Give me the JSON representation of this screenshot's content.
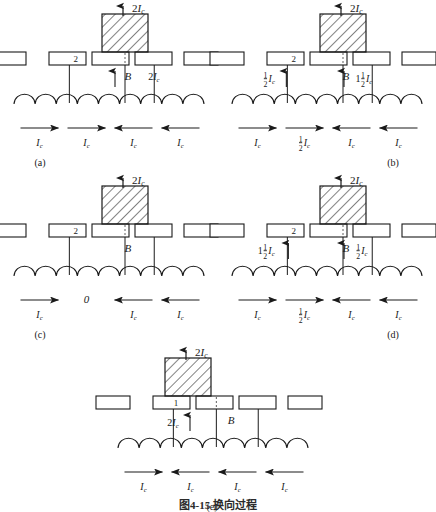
{
  "figure": {
    "caption": "图4-15  换向过程",
    "panels": [
      {
        "id": "a",
        "label": "(a)",
        "segment_label": "2",
        "top_arrow_label": "2Iᴄ",
        "field_label": "B",
        "inner_labels": [
          {
            "text": "B",
            "arrow": "none"
          },
          {
            "text": "2Iᴄ",
            "arrow": "up"
          }
        ],
        "bottom_labels": [
          "Iᴄ",
          "Iᴄ",
          "Iᴄ",
          "Iᴄ"
        ],
        "bottom_arrows": [
          "right",
          "right",
          "left",
          "left"
        ],
        "brush_position": "center"
      },
      {
        "id": "b",
        "label": "(b)",
        "segment_label": "2",
        "top_arrow_label": "2Iᴄ",
        "field_label": "B",
        "inner_labels": [
          {
            "text": "½Iᴄ",
            "arrow": "up"
          },
          {
            "text": "1½Iᴄ",
            "arrow": "up"
          }
        ],
        "bottom_labels": [
          "Iᴄ",
          "½Iᴄ",
          "Iᴄ",
          "Iᴄ"
        ],
        "bottom_arrows": [
          "right",
          "right",
          "left",
          "left"
        ],
        "brush_position": "center"
      },
      {
        "id": "c",
        "label": "(c)",
        "segment_label": "2",
        "top_arrow_label": "2Iᴄ",
        "field_label": "B",
        "inner_labels": [],
        "bottom_labels": [
          "Iᴄ",
          "0",
          "Iᴄ",
          "Iᴄ"
        ],
        "bottom_arrows": [
          "right",
          "none",
          "left",
          "left"
        ],
        "brush_position": "center"
      },
      {
        "id": "d",
        "label": "(d)",
        "segment_label": "2",
        "top_arrow_label": "2Iᴄ",
        "field_label": "B",
        "inner_labels": [
          {
            "text": "1½Iᴄ",
            "arrow": "up"
          },
          {
            "text": "½Iᴄ",
            "arrow": "up"
          }
        ],
        "bottom_labels": [
          "Iᴄ",
          "½Iᴄ",
          "Iᴄ",
          "Iᴄ"
        ],
        "bottom_arrows": [
          "right",
          "right",
          "left",
          "left"
        ],
        "brush_position": "center"
      },
      {
        "id": "e",
        "label": "(e)",
        "segment_label": "1",
        "top_arrow_label": "2Iᴄ",
        "field_label": "B",
        "inner_labels": [
          {
            "text": "2Iᴄ",
            "arrow": "up"
          }
        ],
        "bottom_labels": [
          "Iᴄ",
          "Iᴄ",
          "Iᴄ",
          "Iᴄ"
        ],
        "bottom_arrows": [
          "right",
          "left",
          "left",
          "left"
        ],
        "brush_position": "left"
      }
    ],
    "colors": {
      "stroke": "#1a1a1a",
      "background": "#ffffff",
      "hatch": "#1a1a1a"
    }
  }
}
